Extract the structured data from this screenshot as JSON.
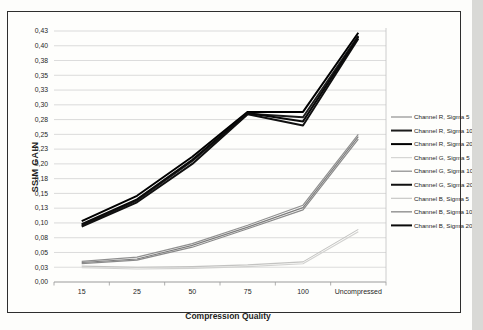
{
  "figure": {
    "background": "#fdfdfb",
    "border_color": "#2e2e2e"
  },
  "chart_data": {
    "type": "line",
    "title": "",
    "xlabel": "Compression Quality",
    "ylabel": "SSIM GAIN",
    "categories": [
      "15",
      "25",
      "50",
      "75",
      "100",
      "Uncompressed"
    ],
    "ylim": [
      0,
      0.425
    ],
    "y_tick_step": 0.025,
    "decimal_separator": ",",
    "y_tick_labels": [
      "0,00",
      "0,03",
      "0,05",
      "0,08",
      "0,10",
      "0,13",
      "0,15",
      "0,18",
      "0,20",
      "0,23",
      "0,25",
      "0,28",
      "0,30",
      "0,33",
      "0,35",
      "0,38",
      "0,40",
      "0,43"
    ],
    "grid": "horizontal",
    "legend_position": "right",
    "series": [
      {
        "name": "Channel R, Sigma 5",
        "color": "#8f8f8f",
        "stroke_width": 1.2,
        "values": [
          0.035,
          0.042,
          0.065,
          0.096,
          0.13,
          0.25
        ]
      },
      {
        "name": "Channel R, Sigma 10",
        "color": "#1c1c1c",
        "stroke_width": 2.0,
        "values": [
          0.096,
          0.138,
          0.205,
          0.285,
          0.279,
          0.417
        ]
      },
      {
        "name": "Channel R, Sigma 20",
        "color": "#000000",
        "stroke_width": 2.0,
        "values": [
          0.103,
          0.146,
          0.212,
          0.288,
          0.288,
          0.422
        ]
      },
      {
        "name": "Channel G, Sigma 5",
        "color": "#d2d2d0",
        "stroke_width": 1.1,
        "values": [
          0.024,
          0.022,
          0.023,
          0.026,
          0.031,
          0.085
        ]
      },
      {
        "name": "Channel G, Sigma 10",
        "color": "#8a8a8a",
        "stroke_width": 1.2,
        "values": [
          0.031,
          0.037,
          0.059,
          0.09,
          0.122,
          0.242
        ]
      },
      {
        "name": "Channel G, Sigma 20",
        "color": "#101010",
        "stroke_width": 2.0,
        "values": [
          0.094,
          0.135,
          0.2,
          0.284,
          0.265,
          0.412
        ]
      },
      {
        "name": "Channel B, Sigma 5",
        "color": "#c3c3c1",
        "stroke_width": 1.1,
        "values": [
          0.027,
          0.025,
          0.026,
          0.029,
          0.034,
          0.089
        ]
      },
      {
        "name": "Channel B, Sigma 10",
        "color": "#7d7d7d",
        "stroke_width": 1.2,
        "values": [
          0.033,
          0.039,
          0.062,
          0.093,
          0.126,
          0.246
        ]
      },
      {
        "name": "Channel B, Sigma 20",
        "color": "#0a0a0a",
        "stroke_width": 2.0,
        "values": [
          0.098,
          0.14,
          0.207,
          0.286,
          0.272,
          0.415
        ]
      }
    ]
  },
  "colors": {
    "gridline": "#d2d2d2",
    "axis_line": "#9a9a9a",
    "tick_mark": "#9a9a9a",
    "plot_right_edge": "#c2c2c2",
    "label_text": "#262626",
    "edge_strip": "#d9d9d6"
  }
}
